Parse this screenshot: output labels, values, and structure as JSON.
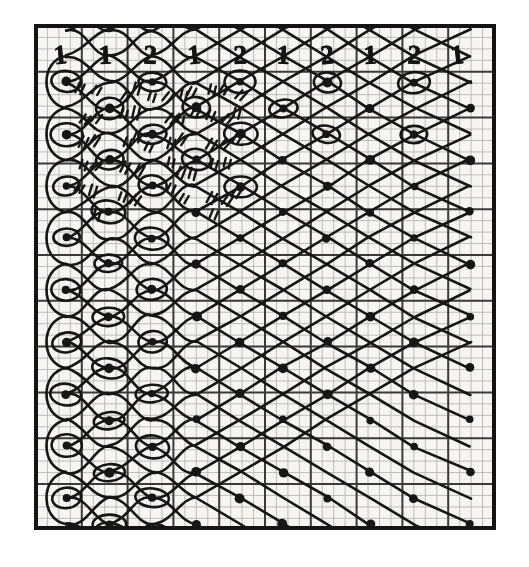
{
  "figure": {
    "kind": "hand-drawn technical diagram",
    "ink_color": "#141414",
    "paper_color": "#f6f5f2",
    "fine_grid_color": "#b9b7b2",
    "major_grid_color": "#2a2a2a",
    "frame": {
      "x": 36,
      "y": 26,
      "width": 458,
      "height": 502,
      "stroke_width": 4
    },
    "grid": {
      "fine_cell_px": 11.45,
      "major_every_n_cells": 4,
      "columns_fine": 40,
      "rows_fine": 44
    }
  },
  "header": {
    "baseline_y": 55,
    "digits": [
      {
        "label": "1",
        "x": 60
      },
      {
        "label": "1",
        "x": 105
      },
      {
        "label": "2",
        "x": 150
      },
      {
        "label": "1",
        "x": 194
      },
      {
        "label": "2",
        "x": 240
      },
      {
        "label": "1",
        "x": 283
      },
      {
        "label": "2",
        "x": 327
      },
      {
        "label": "1",
        "x": 370
      },
      {
        "label": "2",
        "x": 414
      },
      {
        "label": "1",
        "x": 457
      }
    ]
  },
  "chart_data": {
    "type": "line",
    "xlabel": "",
    "ylabel": "",
    "grid": true,
    "legend": "none",
    "xlim": [
      36,
      494
    ],
    "ylim": [
      26,
      528
    ],
    "node_columns_px": [
      66,
      109,
      152,
      196,
      240,
      283,
      327,
      370,
      414,
      470
    ],
    "row_pitch_px": 52,
    "rows": 10,
    "node_styles": {
      "looped_dot": "dot enclosed by a drawn ellipse (loop/turn of the strand)",
      "plain_dot": "plain filled dot (crossing point)"
    },
    "series": [
      {
        "name": "thread-row-1",
        "y": 82,
        "x": [
          66,
          109,
          152,
          196,
          240,
          283,
          327,
          370,
          414,
          470
        ]
      },
      {
        "name": "thread-row-2",
        "y": 134,
        "x": [
          66,
          109,
          152,
          196,
          240,
          283,
          327,
          370,
          414,
          470
        ]
      },
      {
        "name": "thread-row-3",
        "y": 186,
        "x": [
          66,
          109,
          152,
          196,
          240,
          283,
          327,
          370,
          414,
          470
        ]
      },
      {
        "name": "thread-row-4",
        "y": 238,
        "x": [
          66,
          109,
          152,
          196,
          240,
          283,
          327,
          370,
          414,
          470
        ]
      },
      {
        "name": "thread-row-5",
        "y": 290,
        "x": [
          66,
          109,
          152,
          196,
          240,
          283,
          327,
          370,
          414,
          470
        ]
      },
      {
        "name": "thread-row-6",
        "y": 342,
        "x": [
          66,
          109,
          152,
          196,
          240,
          283,
          327,
          370,
          414,
          470
        ]
      },
      {
        "name": "thread-row-7",
        "y": 394,
        "x": [
          66,
          109,
          152,
          196,
          240,
          283,
          327,
          370,
          414,
          470
        ]
      },
      {
        "name": "thread-row-8",
        "y": 446,
        "x": [
          66,
          109,
          152,
          196,
          240,
          283,
          327,
          370,
          414,
          470
        ]
      },
      {
        "name": "thread-row-9",
        "y": 498,
        "x": [
          66,
          109,
          152,
          196,
          240,
          283,
          327,
          370,
          414,
          470
        ]
      },
      {
        "name": "thread-row-10",
        "y": 524,
        "x": [
          66,
          109,
          152,
          196,
          240,
          283,
          327,
          370,
          414,
          470
        ]
      }
    ],
    "hatch_marks": {
      "description": "short paired tick strokes crossing the threads",
      "region": "upper-left quadrant",
      "approx_count": 46
    }
  }
}
